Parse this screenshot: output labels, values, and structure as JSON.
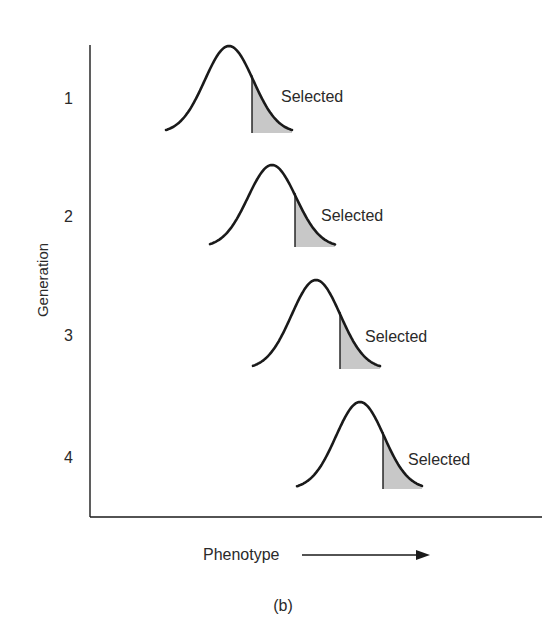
{
  "figure": {
    "panel_label": "(b)",
    "y_axis_label": "Generation",
    "x_axis_label": "Phenotype",
    "selected_label": "Selected"
  },
  "colors": {
    "ink": "#1a1a1a",
    "shade": "#c8c8c8",
    "text": "#2a2a2a"
  },
  "generations": [
    {
      "label": "1",
      "tick_y": 98,
      "left": 166,
      "peak_x": 229,
      "peak_y": 46,
      "cut_x": 252,
      "right": 292,
      "base_y": 133,
      "label_x": 281,
      "label_y": 102
    },
    {
      "label": "2",
      "tick_y": 216,
      "left": 210,
      "peak_x": 272,
      "peak_y": 165,
      "cut_x": 295,
      "right": 335,
      "base_y": 247,
      "label_x": 321,
      "label_y": 221
    },
    {
      "label": "3",
      "tick_y": 335,
      "left": 253,
      "peak_x": 316,
      "peak_y": 280,
      "cut_x": 340,
      "right": 380,
      "base_y": 369,
      "label_x": 365,
      "label_y": 342
    },
    {
      "label": "4",
      "tick_y": 457,
      "left": 297,
      "peak_x": 360,
      "peak_y": 402,
      "cut_x": 383,
      "right": 422,
      "base_y": 489,
      "label_x": 408,
      "label_y": 465
    }
  ]
}
